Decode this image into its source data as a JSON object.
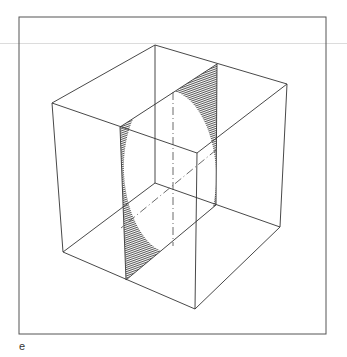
{
  "figure": {
    "label": "e",
    "colors": {
      "line": "#333333",
      "shading": "#1a1a1a",
      "frame": "#555555",
      "rule": "#dcdcdc"
    },
    "frame": {
      "x": 19,
      "y": 17,
      "width": 307,
      "height": 317
    },
    "cube": {
      "vertices": {
        "top_back": [
          155,
          45
        ],
        "left_top": [
          52,
          103
        ],
        "right_top": [
          287,
          84
        ],
        "front_top": [
          197,
          153
        ],
        "back_bottom": [
          155,
          183
        ],
        "left_bottom": [
          63,
          252
        ],
        "right_bottom": [
          280,
          227
        ],
        "front_bottom": [
          195,
          309
        ]
      }
    },
    "slice": {
      "corners": [
        [
          120,
          127
        ],
        [
          217,
          64
        ],
        [
          216,
          205
        ],
        [
          126,
          280
        ]
      ]
    }
  }
}
